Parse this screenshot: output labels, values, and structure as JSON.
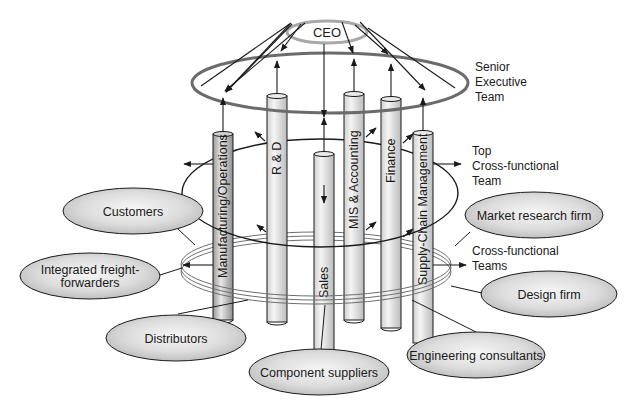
{
  "diagram": {
    "type": "organizational structure",
    "ceo": {
      "label": "CEO"
    },
    "tiers": [
      {
        "id": "senior",
        "label_lines": [
          "Senior",
          "Executive",
          "Team"
        ]
      },
      {
        "id": "top",
        "label_lines": [
          "Top",
          "Cross-functional",
          "Team"
        ]
      },
      {
        "id": "cross",
        "label_lines": [
          "Cross-functional",
          "Teams"
        ]
      }
    ],
    "pillars": [
      {
        "id": "mfg",
        "label": "Manufacturing/Operations"
      },
      {
        "id": "rd",
        "label": "R & D"
      },
      {
        "id": "sales",
        "label": "Sales"
      },
      {
        "id": "mis",
        "label": "MIS & Accounting"
      },
      {
        "id": "finance",
        "label": "Finance"
      },
      {
        "id": "scm",
        "label": "Supply-Chain Management"
      }
    ],
    "partners": [
      {
        "id": "customers",
        "label_lines": [
          "Customers"
        ]
      },
      {
        "id": "freight",
        "label_lines": [
          "Integrated freight-",
          "forwarders"
        ]
      },
      {
        "id": "distributors",
        "label_lines": [
          "Distributors"
        ]
      },
      {
        "id": "components",
        "label_lines": [
          "Component suppliers"
        ]
      },
      {
        "id": "engineering",
        "label_lines": [
          "Engineering consultants"
        ]
      },
      {
        "id": "design",
        "label_lines": [
          "Design firm"
        ]
      },
      {
        "id": "market",
        "label_lines": [
          "Market research firm"
        ]
      }
    ],
    "colors": {
      "line": "#1a1a1a",
      "ring_gray": "#6e6e6e",
      "ceo_ring": "#a8a8a8",
      "ellipse_fill_light": "#f4f4f4",
      "ellipse_fill_dark": "#bdbdbd"
    }
  }
}
